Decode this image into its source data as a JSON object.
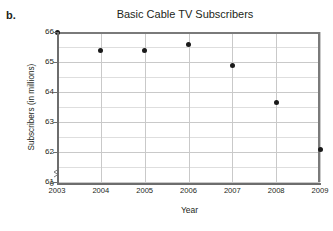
{
  "part_label": "b.",
  "chart_data": {
    "type": "scatter",
    "title": "Basic Cable TV Subscribers",
    "xlabel": "Year",
    "ylabel": "Subscribers (in millions)",
    "x": [
      2003,
      2004,
      2005,
      2006,
      2007,
      2008,
      2009
    ],
    "values": [
      66.0,
      65.4,
      65.4,
      65.6,
      64.9,
      63.65,
      62.1
    ],
    "categories": [
      "2003",
      "2004",
      "2005",
      "2006",
      "2007",
      "2008",
      "2009"
    ],
    "xtick_labels": [
      "2003",
      "2004",
      "2005",
      "2006",
      "2007",
      "2008",
      "2009"
    ],
    "ytick_labels": [
      "66",
      "65",
      "64",
      "63",
      "62",
      "61",
      "0"
    ],
    "ytick_values": [
      66,
      65,
      64,
      63,
      62,
      61,
      0
    ],
    "ylim": [
      61,
      66
    ],
    "xlim": [
      2003,
      2009
    ],
    "grid": true,
    "minor_grid_step": 0.5,
    "axis_break": true,
    "legend": null,
    "marker_color": "#1a1a1a",
    "grid_color": "#c9c9c9",
    "frame_color": "#7a7a7a"
  }
}
